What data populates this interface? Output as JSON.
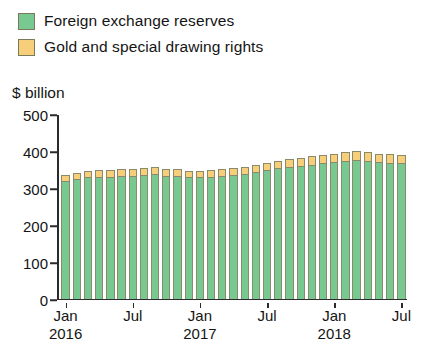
{
  "legend": {
    "items": [
      {
        "label": "Foreign exchange reserves",
        "color": "#78c892"
      },
      {
        "label": "Gold and special drawing rights",
        "color": "#f7cf7a"
      }
    ]
  },
  "axis": {
    "unit_label": "$ billion",
    "y_ticks": [
      "0",
      "100",
      "200",
      "300",
      "400",
      "500"
    ],
    "x_ticks": [
      {
        "label": "Jan",
        "year": "2016"
      },
      {
        "label": "Jul",
        "year": ""
      },
      {
        "label": "Jan",
        "year": "2017"
      },
      {
        "label": "Jul",
        "year": ""
      },
      {
        "label": "Jan",
        "year": "2018"
      },
      {
        "label": "Jul",
        "year": ""
      }
    ]
  },
  "chart_data": {
    "type": "bar",
    "title": "",
    "xlabel": "",
    "ylabel": "$ billion",
    "ylim": [
      0,
      500
    ],
    "grid": false,
    "legend_position": "top-left",
    "stacked": true,
    "categories": [
      "Jan 2016",
      "Feb 2016",
      "Mar 2016",
      "Apr 2016",
      "May 2016",
      "Jun 2016",
      "Jul 2016",
      "Aug 2016",
      "Sep 2016",
      "Oct 2016",
      "Nov 2016",
      "Dec 2016",
      "Jan 2017",
      "Feb 2017",
      "Mar 2017",
      "Apr 2017",
      "May 2017",
      "Jun 2017",
      "Jul 2017",
      "Aug 2017",
      "Sep 2017",
      "Oct 2017",
      "Nov 2017",
      "Dec 2017",
      "Jan 2018",
      "Feb 2018",
      "Mar 2018",
      "Apr 2018",
      "May 2018",
      "Jun 2018",
      "Jul 2018"
    ],
    "series": [
      {
        "name": "Foreign exchange reserves",
        "color": "#78c892",
        "values": [
          320,
          325,
          330,
          332,
          332,
          333,
          335,
          337,
          338,
          335,
          333,
          330,
          330,
          332,
          335,
          337,
          340,
          345,
          350,
          355,
          358,
          362,
          365,
          368,
          372,
          376,
          378,
          375,
          372,
          370,
          368
        ]
      },
      {
        "name": "Gold and special drawing rights",
        "color": "#f7cf7a",
        "values": [
          16,
          17,
          18,
          18,
          18,
          19,
          19,
          20,
          20,
          19,
          19,
          18,
          18,
          18,
          19,
          19,
          19,
          20,
          20,
          21,
          21,
          22,
          22,
          22,
          23,
          24,
          25,
          24,
          23,
          23,
          22
        ]
      }
    ]
  }
}
